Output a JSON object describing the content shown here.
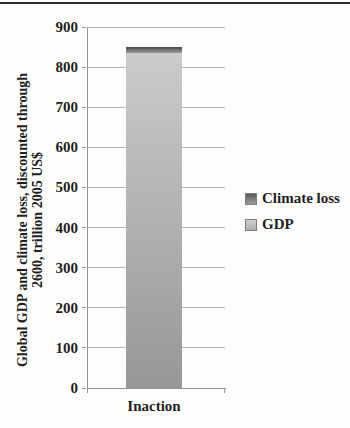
{
  "chart_data": {
    "type": "bar",
    "stacked": true,
    "categories": [
      "Inaction"
    ],
    "series": [
      {
        "name": "GDP",
        "values": [
          835
        ]
      },
      {
        "name": "Climate loss",
        "values": [
          15
        ]
      }
    ],
    "title": "",
    "xlabel": "",
    "ylabel": "Global GDP and climate loss, discounted through 2600, trillion 2005 US$",
    "ylabel_lines": [
      "Global GDP and climate loss, discounted through",
      "2600, trillion 2005 US$"
    ],
    "ylim": [
      0,
      900
    ],
    "yticks": [
      0,
      100,
      200,
      300,
      400,
      500,
      600,
      700,
      800,
      900
    ],
    "grid": true,
    "legend_position": "right",
    "legend": [
      "Climate loss",
      "GDP"
    ]
  },
  "colors": {
    "page_bg": "#fdfdfb",
    "top_rule": "#2d2d2d",
    "gridline": "#b4b4b4",
    "axis": "#949494",
    "text": "#1f1f1f",
    "gdp_segment_top": "#cbcbcb",
    "gdp_segment_bottom": "#979797",
    "loss_segment_top": "#484848",
    "loss_segment_bottom": "#9b9b9b",
    "legend_loss_swatch_top": "#5a5a5a",
    "legend_loss_swatch_bottom": "#9c9c9c",
    "legend_gdp_swatch_top": "#cdcdcd",
    "legend_gdp_swatch_bottom": "#b0b0b0",
    "swatch_border": "#7e7e7e"
  }
}
